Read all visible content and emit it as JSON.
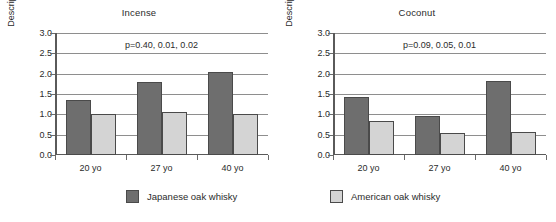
{
  "figure": {
    "ylabel": "Description score",
    "legend": [
      {
        "key": "japanese",
        "label": "Japanese oak whisky",
        "color": "#6e6e6e"
      },
      {
        "key": "american",
        "label": "American oak whisky",
        "color": "#d4d4d4"
      }
    ]
  },
  "chart_data": [
    {
      "type": "bar",
      "title": "Incense",
      "xlabel": "",
      "ylabel": "Description score",
      "ylim": [
        0,
        3
      ],
      "yticks": [
        "0.0",
        "0.5",
        "1.0",
        "1.5",
        "2.0",
        "2.5",
        "3.0"
      ],
      "grid": true,
      "legend_position": "bottom",
      "categories": [
        "20 yo",
        "27 yo",
        "40 yo"
      ],
      "annotation": "p=0.40, 0.01, 0.02",
      "series": [
        {
          "name": "Japanese oak whisky",
          "color": "#6e6e6e",
          "values": [
            1.35,
            1.8,
            2.05
          ]
        },
        {
          "name": "American oak whisky",
          "color": "#d4d4d4",
          "values": [
            1.0,
            1.05,
            1.02
          ]
        }
      ]
    },
    {
      "type": "bar",
      "title": "Coconut",
      "xlabel": "",
      "ylabel": "Description score",
      "ylim": [
        0,
        3
      ],
      "yticks": [
        "0.0",
        "0.5",
        "1.0",
        "1.5",
        "2.0",
        "2.5",
        "3.0"
      ],
      "grid": true,
      "legend_position": "bottom",
      "categories": [
        "20 yo",
        "27 yo",
        "40 yo"
      ],
      "annotation": "p=0.09, 0.05, 0.01",
      "series": [
        {
          "name": "Japanese oak whisky",
          "color": "#6e6e6e",
          "values": [
            1.42,
            0.95,
            1.83
          ]
        },
        {
          "name": "American oak whisky",
          "color": "#d4d4d4",
          "values": [
            0.83,
            0.55,
            0.56
          ]
        }
      ]
    }
  ]
}
